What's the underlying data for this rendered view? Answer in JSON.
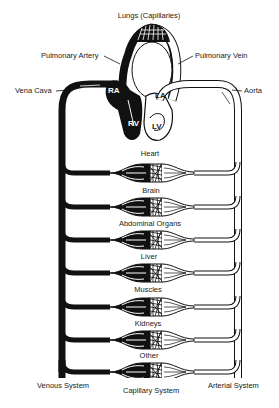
{
  "diagram": {
    "title": "Lungs (Capillaries)",
    "pulmonary": {
      "artery_label": "Pulmonary Artery",
      "vein_label": "Pulmonary Vein"
    },
    "vessels": {
      "vena_cava_label": "Vena Cava",
      "aorta_label": "Aorta"
    },
    "heart_chambers": {
      "ra": "RA",
      "rv": "RV",
      "la": "LA",
      "lv": "LV"
    },
    "organs": [
      {
        "label": "Heart"
      },
      {
        "label": "Brain"
      },
      {
        "label": "Abdominal Organs"
      },
      {
        "label": "Liver"
      },
      {
        "label": "Muscles"
      },
      {
        "label": "Kidneys"
      },
      {
        "label": "Other"
      }
    ],
    "systems": {
      "venous": "Venous System",
      "capillary": "Capillary System",
      "arterial": "Arterial System"
    },
    "colors": {
      "deoxygenated": "#111111",
      "oxygenated": "#ffffff",
      "outline": "#1a1a1a"
    }
  }
}
